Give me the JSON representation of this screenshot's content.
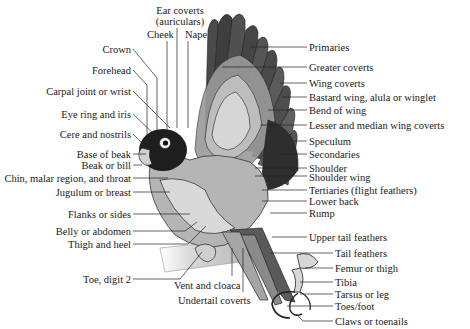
{
  "diagram": {
    "colors": {
      "ink": "#1a1a1a",
      "leader": "#222222",
      "background": "#ffffff"
    },
    "top_labels": [
      {
        "id": "ear-coverts",
        "text": "Ear coverts",
        "x": 178,
        "y": 5,
        "w": 60
      },
      {
        "id": "ear-coverts-2",
        "text": "(auriculars)",
        "x": 178,
        "y": 16,
        "w": 60
      },
      {
        "id": "cheek",
        "text": "Cheek",
        "x": 147,
        "y": 29,
        "w": 30
      },
      {
        "id": "nape",
        "text": "Nape",
        "x": 185,
        "y": 29,
        "w": 28
      }
    ],
    "left_labels": [
      {
        "id": "crown",
        "text": "Crown",
        "y": 44
      },
      {
        "id": "forehead",
        "text": "Forehead",
        "y": 66
      },
      {
        "id": "carpal-joint",
        "text": "Carpal joint or wrist",
        "y": 87
      },
      {
        "id": "eye-ring",
        "text": "Eye ring and iris",
        "y": 110
      },
      {
        "id": "cere",
        "text": "Cere and nostrils",
        "y": 130
      },
      {
        "id": "base-of-beak",
        "text": "Base of beak",
        "y": 150
      },
      {
        "id": "beak",
        "text": "Beak or bill",
        "y": 161
      },
      {
        "id": "chin",
        "text": "Chin, malar region, and throat",
        "y": 174
      },
      {
        "id": "jugulum",
        "text": "Jugulum or breast",
        "y": 188
      },
      {
        "id": "flanks",
        "text": "Flanks or sides",
        "y": 210
      },
      {
        "id": "belly",
        "text": "Belly or abdomen",
        "y": 227
      },
      {
        "id": "thigh-heel",
        "text": "Thigh  and heel",
        "y": 240
      },
      {
        "id": "toe-digit-2",
        "text": "Toe, digit 2",
        "y": 275
      }
    ],
    "bottom_labels": [
      {
        "id": "vent",
        "text": "Vent and cloaca",
        "x": 172,
        "y": 280
      },
      {
        "id": "undertail-coverts",
        "text": "Undertail coverts",
        "x": 178,
        "y": 295
      }
    ],
    "right_labels": [
      {
        "id": "primaries",
        "text": "Primaries",
        "x": 309,
        "y": 42
      },
      {
        "id": "greater-coverts",
        "text": "Greater coverts",
        "x": 309,
        "y": 62
      },
      {
        "id": "wing-coverts",
        "text": "Wing coverts",
        "x": 309,
        "y": 78
      },
      {
        "id": "bastard-wing",
        "text": "Bastard wing, alula or winglet",
        "x": 309,
        "y": 92
      },
      {
        "id": "bend-of-wing",
        "text": "Bend of wing",
        "x": 309,
        "y": 105
      },
      {
        "id": "lesser-median-coverts",
        "text": "Lesser and median wing coverts",
        "x": 309,
        "y": 120
      },
      {
        "id": "speculum",
        "text": "Speculum",
        "x": 309,
        "y": 136
      },
      {
        "id": "secondaries",
        "text": "Secondaries",
        "x": 309,
        "y": 149
      },
      {
        "id": "shoulder",
        "text": "Shoulder",
        "x": 309,
        "y": 163
      },
      {
        "id": "shoulder-wing",
        "text": "Shoulder wing",
        "x": 309,
        "y": 173
      },
      {
        "id": "tertiaries",
        "text": "Tertiaries (flight feathers)",
        "x": 309,
        "y": 185
      },
      {
        "id": "lower-back",
        "text": "Lower back",
        "x": 309,
        "y": 196
      },
      {
        "id": "rump",
        "text": "Rump",
        "x": 309,
        "y": 208
      },
      {
        "id": "upper-tail-feathers",
        "text": "Upper tail feathers",
        "x": 309,
        "y": 232
      },
      {
        "id": "tail-feathers",
        "text": "Tail feathers",
        "x": 335,
        "y": 248
      },
      {
        "id": "femur",
        "text": "Femur or thigh",
        "x": 335,
        "y": 263
      },
      {
        "id": "tibia",
        "text": "Tibia",
        "x": 335,
        "y": 277
      },
      {
        "id": "tarsus",
        "text": "Tarsus or leg",
        "x": 335,
        "y": 289
      },
      {
        "id": "toes-foot",
        "text": "Toes/foot",
        "x": 335,
        "y": 301
      },
      {
        "id": "claws",
        "text": "Claws or toenails",
        "x": 335,
        "y": 316
      }
    ]
  }
}
